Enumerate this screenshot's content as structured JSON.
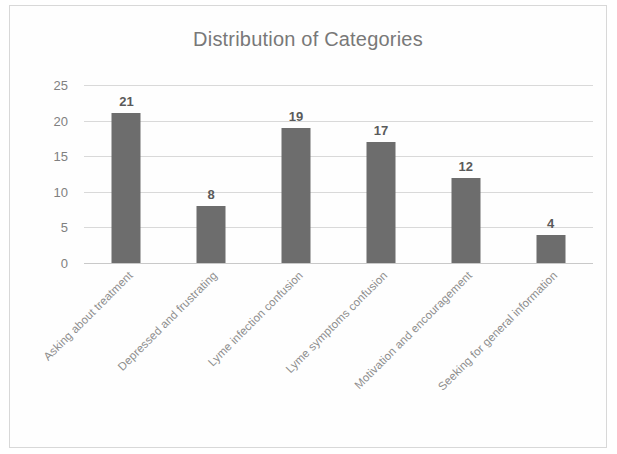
{
  "chart_data": {
    "type": "bar",
    "title": "Distribution of Categories",
    "xlabel": "",
    "ylabel": "",
    "categories": [
      "Asking about treatment",
      "Depressed and frustrating",
      "Lyme infection confusion",
      "Lyme symptoms confusion",
      "Motivation and encouragement",
      "Seeking for general information"
    ],
    "values": [
      21,
      8,
      19,
      17,
      12,
      4
    ],
    "data_labels": [
      "21",
      "8",
      "19",
      "17",
      "12",
      "4"
    ],
    "ylim": [
      0,
      25
    ],
    "yticks": [
      0,
      5,
      10,
      15,
      20,
      25
    ],
    "ytick_labels": [
      "0",
      "5",
      "10",
      "15",
      "20",
      "25"
    ],
    "grid": "horizontal",
    "legend": "none",
    "bar_color": "#6d6d6d",
    "gridline_color": "#d9d9d9",
    "title_color": "#787878",
    "tick_label_color": "#808080",
    "category_label_color": "#8d8d8d",
    "category_label_rotation": -45,
    "frame_border_color": "#d8d8d8",
    "background_color": "#ffffff"
  }
}
